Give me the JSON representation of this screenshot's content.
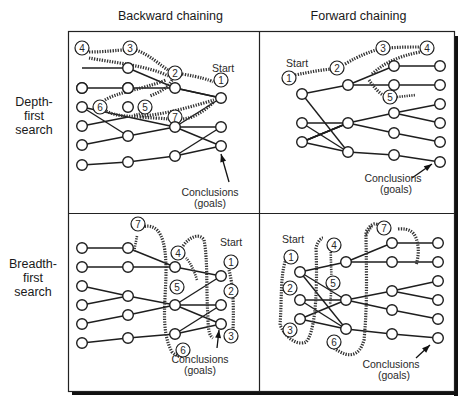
{
  "columns": [
    "Backward chaining",
    "Forward chaining"
  ],
  "rows": [
    [
      "Depth-",
      "first",
      "search"
    ],
    [
      "Breadth-",
      "first",
      "search"
    ]
  ],
  "labels": {
    "start": "Start",
    "conclusions": "Conclusions",
    "goals": "(goals)"
  },
  "panels": {
    "bc_dfs": {
      "order": [
        "1",
        "2",
        "3",
        "4",
        "5",
        "6",
        "7"
      ]
    },
    "fc_dfs": {
      "order": [
        "1",
        "2",
        "3",
        "4",
        "5"
      ]
    },
    "bc_bfs": {
      "order": [
        "1",
        "2",
        "3",
        "4",
        "5",
        "6",
        "7"
      ]
    },
    "fc_bfs": {
      "order": [
        "1",
        "2",
        "3",
        "4",
        "5",
        "6",
        "7"
      ]
    }
  }
}
